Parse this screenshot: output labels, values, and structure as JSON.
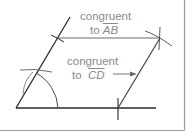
{
  "diagram": {
    "type": "geometry-construction",
    "colors": {
      "line": "#2a2a2a",
      "arc": "#5a5a5a",
      "text": "#8a8a8a",
      "border": "#9a9a9a",
      "background": "#ffffff"
    },
    "labels": {
      "top": {
        "line1": "congruent",
        "line2_prefix": "to ",
        "segment": "AB"
      },
      "middle": {
        "line1": "congruent",
        "line2_prefix": "to ",
        "segment": "CD"
      }
    },
    "elements": [
      "base line",
      "slanted line from vertex",
      "arc copying angle",
      "top side congruent to AB",
      "right side congruent to CD",
      "compass intersection marks",
      "arrow pointing to right side"
    ]
  }
}
